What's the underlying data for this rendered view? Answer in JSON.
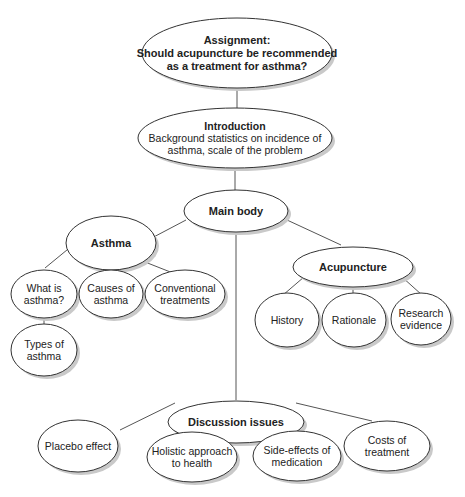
{
  "diagram": {
    "type": "tree-mind-map",
    "nodes": {
      "assignment": {
        "title": "Assignment:",
        "lines": [
          "Should acupuncture be recommended",
          "as a treatment for asthma?"
        ]
      },
      "introduction": {
        "title": "Introduction",
        "lines": [
          "Background statistics on incidence of",
          "asthma, scale of the problem"
        ]
      },
      "main_body": {
        "title": "Main body"
      },
      "asthma": {
        "title": "Asthma"
      },
      "what_is_asthma": {
        "lines": [
          "What is",
          "asthma?"
        ]
      },
      "causes_of_asthma": {
        "lines": [
          "Causes of",
          "asthma"
        ]
      },
      "conventional_treatments": {
        "lines": [
          "Conventional",
          "treatments"
        ]
      },
      "types_of_asthma": {
        "lines": [
          "Types of",
          "asthma"
        ]
      },
      "acupuncture": {
        "title": "Acupuncture"
      },
      "history": {
        "lines": [
          "History"
        ]
      },
      "rationale": {
        "lines": [
          "Rationale"
        ]
      },
      "research_evidence": {
        "lines": [
          "Research",
          "evidence"
        ]
      },
      "discussion_issues": {
        "title": "Discussion issues"
      },
      "placebo_effect": {
        "lines": [
          "Placebo effect"
        ]
      },
      "holistic_approach": {
        "lines": [
          "Holistic approach",
          "to health"
        ]
      },
      "side_effects": {
        "lines": [
          "Side-effects of",
          "medication"
        ]
      },
      "costs_of_treatment": {
        "lines": [
          "Costs of",
          "treatment"
        ]
      }
    },
    "edges": [
      [
        "assignment",
        "introduction"
      ],
      [
        "introduction",
        "main_body"
      ],
      [
        "main_body",
        "asthma"
      ],
      [
        "main_body",
        "acupuncture"
      ],
      [
        "main_body",
        "discussion_issues"
      ],
      [
        "asthma",
        "what_is_asthma"
      ],
      [
        "asthma",
        "causes_of_asthma"
      ],
      [
        "asthma",
        "conventional_treatments"
      ],
      [
        "what_is_asthma",
        "types_of_asthma"
      ],
      [
        "acupuncture",
        "history"
      ],
      [
        "acupuncture",
        "rationale"
      ],
      [
        "acupuncture",
        "research_evidence"
      ],
      [
        "discussion_issues",
        "placebo_effect"
      ],
      [
        "discussion_issues",
        "holistic_approach"
      ],
      [
        "discussion_issues",
        "side_effects"
      ],
      [
        "discussion_issues",
        "costs_of_treatment"
      ]
    ]
  }
}
